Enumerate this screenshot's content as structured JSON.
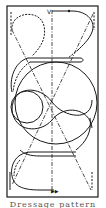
{
  "diagram": {
    "frame": {
      "x": 7,
      "y": 6,
      "w": 91,
      "h": 191
    },
    "stroke_color": "#1a1a1a",
    "background": "#ffffff",
    "markers": {
      "start_top": "V",
      "end_bottom": "▶▶"
    },
    "elements": [
      "rectangular arena outline",
      "vertical dash-dot center line",
      "two dash-dot diagonals crossing at center",
      "large center circle",
      "figure-eight S-curve through center",
      "teardrop loop upper-left",
      "half-turn upper-right",
      "serpentine lower section"
    ]
  },
  "caption": {
    "text": "Dressage  pattern"
  }
}
